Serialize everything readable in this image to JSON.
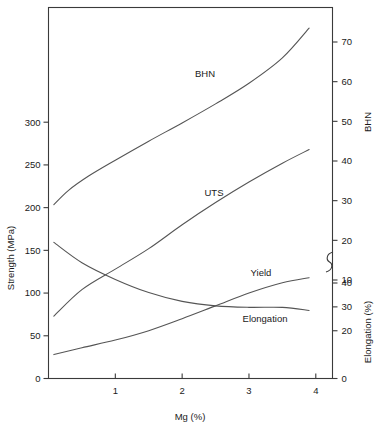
{
  "chart_data": {
    "type": "line",
    "title": "",
    "xlabel": "Mg (%)",
    "ylabel": "Strength (MPa)",
    "y2label_top": "BHN",
    "y2label_bottom": "Elongation (%)",
    "xlim": [
      0,
      4.25
    ],
    "xticks": [
      1,
      2,
      3,
      4
    ],
    "xticklabels": [
      "1",
      "2",
      "3",
      "4"
    ],
    "ylim": [
      0,
      345
    ],
    "yticks": [
      0,
      50,
      100,
      150,
      200,
      250,
      300
    ],
    "yticklabels": [
      "0",
      "50",
      "100",
      "150",
      "200",
      "250",
      "300"
    ],
    "y2_bhn_ticks": [
      10,
      20,
      30,
      40,
      50,
      60,
      70
    ],
    "y2_bhn_ticklabels": [
      "10",
      "20",
      "30",
      "40",
      "50",
      "60",
      "70"
    ],
    "y2_elong_ticks": [
      0,
      20,
      30,
      40
    ],
    "y2_elong_ticklabels": [
      "0",
      "20",
      "30",
      "40"
    ],
    "axis_break": true,
    "grid": false,
    "legend": "inline-labels",
    "series": [
      {
        "name": "BHN",
        "label": "BHN",
        "axis": "right-bhn",
        "units": "BHN",
        "x": [
          0.08,
          0.3,
          0.6,
          1.0,
          1.5,
          2.0,
          2.5,
          3.0,
          3.5,
          3.9
        ],
        "values": [
          29.0,
          32.6,
          36.2,
          40.2,
          45.0,
          49.6,
          54.4,
          59.6,
          66.0,
          73.5
        ]
      },
      {
        "name": "UTS",
        "label": "UTS",
        "axis": "left",
        "units": "MPa",
        "x": [
          0.08,
          0.5,
          1.0,
          1.5,
          2.0,
          2.5,
          3.0,
          3.5,
          3.9
        ],
        "values": [
          73,
          104,
          128,
          152,
          180,
          206,
          230,
          252,
          268
        ]
      },
      {
        "name": "Yield",
        "label": "Yield",
        "axis": "left",
        "units": "MPa",
        "x": [
          0.08,
          0.5,
          1.0,
          1.5,
          2.0,
          2.5,
          3.0,
          3.5,
          3.9
        ],
        "values": [
          28,
          36,
          45,
          56,
          70,
          85,
          100,
          112,
          118
        ]
      },
      {
        "name": "Elongation",
        "label": "Elongation",
        "axis": "right-elongation",
        "units": "%",
        "x": [
          0.08,
          0.5,
          1.0,
          1.5,
          2.0,
          2.5,
          3.0,
          3.5,
          3.9
        ],
        "values": [
          57.0,
          48.5,
          41.5,
          36.0,
          32.3,
          30.4,
          29.8,
          29.8,
          28.5
        ]
      }
    ],
    "annotations": [
      {
        "text": "BHN",
        "x_px": 205,
        "y_px": 77
      },
      {
        "text": "UTS",
        "x_px": 214,
        "y_px": 196
      },
      {
        "text": "Yield",
        "x_px": 261,
        "y_px": 276
      },
      {
        "text": "Elongation",
        "x_px": 265,
        "y_px": 322
      }
    ]
  },
  "axes": {
    "left_title": "Strength (MPa)",
    "right_title_top": "BHN",
    "right_title_bottom": "Elongation (%)",
    "bottom_title": "Mg (%)"
  }
}
